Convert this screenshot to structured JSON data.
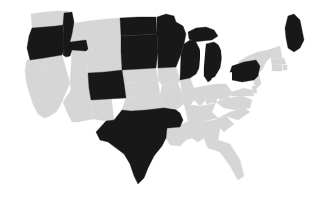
{
  "map": {
    "title": "United States choropleth map",
    "region_scope": "contiguous-united-states",
    "projection_note": "albers-usa",
    "colors": {
      "background": "#ffffff",
      "state_default": "#d6d6d6",
      "state_highlighted": "#181818",
      "border": "#3a3a3a",
      "water": "#ffffff"
    },
    "legend_visible": false,
    "labels_visible": false,
    "highlight_count": 12,
    "states": [
      {
        "code": "WA",
        "name": "Washington",
        "highlighted": false
      },
      {
        "code": "OR",
        "name": "Oregon",
        "highlighted": true
      },
      {
        "code": "CA",
        "name": "California",
        "highlighted": false
      },
      {
        "code": "NV",
        "name": "Nevada",
        "highlighted": false
      },
      {
        "code": "ID",
        "name": "Idaho",
        "highlighted": true
      },
      {
        "code": "MT",
        "name": "Montana",
        "highlighted": false
      },
      {
        "code": "WY",
        "name": "Wyoming",
        "highlighted": false
      },
      {
        "code": "UT",
        "name": "Utah",
        "highlighted": false
      },
      {
        "code": "AZ",
        "name": "Arizona",
        "highlighted": false
      },
      {
        "code": "NM",
        "name": "New Mexico",
        "highlighted": false
      },
      {
        "code": "CO",
        "name": "Colorado",
        "highlighted": true
      },
      {
        "code": "ND",
        "name": "North Dakota",
        "highlighted": true
      },
      {
        "code": "SD",
        "name": "South Dakota",
        "highlighted": true
      },
      {
        "code": "NE",
        "name": "Nebraska",
        "highlighted": false
      },
      {
        "code": "KS",
        "name": "Kansas",
        "highlighted": false
      },
      {
        "code": "OK",
        "name": "Oklahoma",
        "highlighted": false
      },
      {
        "code": "TX",
        "name": "Texas",
        "highlighted": true
      },
      {
        "code": "MN",
        "name": "Minnesota",
        "highlighted": true
      },
      {
        "code": "IA",
        "name": "Iowa",
        "highlighted": false
      },
      {
        "code": "MO",
        "name": "Missouri",
        "highlighted": false
      },
      {
        "code": "AR",
        "name": "Arkansas",
        "highlighted": true
      },
      {
        "code": "LA",
        "name": "Louisiana",
        "highlighted": false
      },
      {
        "code": "WI",
        "name": "Wisconsin",
        "highlighted": true
      },
      {
        "code": "IL",
        "name": "Illinois",
        "highlighted": false
      },
      {
        "code": "MI",
        "name": "Michigan",
        "highlighted": true
      },
      {
        "code": "IN",
        "name": "Indiana",
        "highlighted": false
      },
      {
        "code": "OH",
        "name": "Ohio",
        "highlighted": false
      },
      {
        "code": "KY",
        "name": "Kentucky",
        "highlighted": false
      },
      {
        "code": "TN",
        "name": "Tennessee",
        "highlighted": false
      },
      {
        "code": "MS",
        "name": "Mississippi",
        "highlighted": false
      },
      {
        "code": "AL",
        "name": "Alabama",
        "highlighted": false
      },
      {
        "code": "GA",
        "name": "Georgia",
        "highlighted": false
      },
      {
        "code": "FL",
        "name": "Florida",
        "highlighted": false
      },
      {
        "code": "SC",
        "name": "South Carolina",
        "highlighted": false
      },
      {
        "code": "NC",
        "name": "North Carolina",
        "highlighted": false
      },
      {
        "code": "VA",
        "name": "Virginia",
        "highlighted": false
      },
      {
        "code": "WV",
        "name": "West Virginia",
        "highlighted": false
      },
      {
        "code": "MD",
        "name": "Maryland",
        "highlighted": false
      },
      {
        "code": "DE",
        "name": "Delaware",
        "highlighted": false
      },
      {
        "code": "PA",
        "name": "Pennsylvania",
        "highlighted": true
      },
      {
        "code": "NJ",
        "name": "New Jersey",
        "highlighted": false
      },
      {
        "code": "NY",
        "name": "New York",
        "highlighted": false
      },
      {
        "code": "CT",
        "name": "Connecticut",
        "highlighted": false
      },
      {
        "code": "RI",
        "name": "Rhode Island",
        "highlighted": false
      },
      {
        "code": "MA",
        "name": "Massachusetts",
        "highlighted": false
      },
      {
        "code": "VT",
        "name": "Vermont",
        "highlighted": false
      },
      {
        "code": "NH",
        "name": "New Hampshire",
        "highlighted": false
      },
      {
        "code": "ME",
        "name": "Maine",
        "highlighted": true
      }
    ]
  }
}
